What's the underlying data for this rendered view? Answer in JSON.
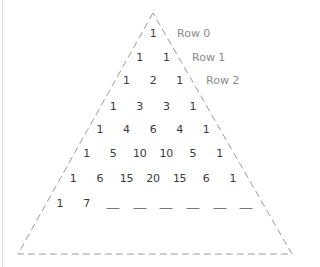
{
  "diagram": {
    "colors": {
      "numbers": "#3a3a3a",
      "labels": "#8a8a8a",
      "outline": "#9a9a9a"
    },
    "rows": [
      {
        "label": "Row 0",
        "values": [
          "1"
        ]
      },
      {
        "label": "Row 1",
        "values": [
          "1",
          "1"
        ]
      },
      {
        "label": "Row 2",
        "values": [
          "1",
          "2",
          "1"
        ]
      },
      {
        "label": "",
        "values": [
          "1",
          "3",
          "3",
          "1"
        ]
      },
      {
        "label": "",
        "values": [
          "1",
          "4",
          "6",
          "4",
          "1"
        ]
      },
      {
        "label": "",
        "values": [
          "1",
          "5",
          "10",
          "10",
          "5",
          "1"
        ]
      },
      {
        "label": "",
        "values": [
          "1",
          "6",
          "15",
          "20",
          "15",
          "6",
          "1"
        ]
      },
      {
        "label": "",
        "values": [
          "1",
          "7",
          "_",
          "_",
          "_",
          "_",
          "_",
          "_"
        ]
      }
    ]
  }
}
